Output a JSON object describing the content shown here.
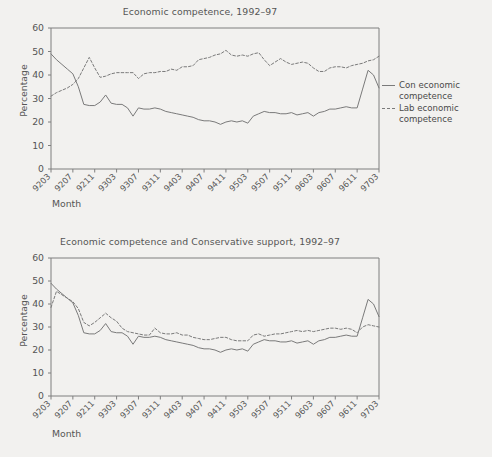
{
  "figure": {
    "background_color": "#f2f1ef",
    "line_color": "#7a7a7a",
    "text_color": "#555555",
    "axis_color": "#7f7f7f"
  },
  "panels": [
    {
      "id": "top",
      "title": "Economic competence, 1992–97",
      "ylabel": "Percentage",
      "xlabel": "Month",
      "legend": [
        {
          "label": "Con economic\ncompetence",
          "style": "solid"
        },
        {
          "label": "Lab economic\ncompetence",
          "style": "dashed"
        }
      ]
    },
    {
      "id": "bottom",
      "title": "Economic competence and Conservative support, 1992–97",
      "ylabel": "Percentage",
      "xlabel": "Month",
      "legend": [
        {
          "label": "Con economic\ncompetence",
          "style": "solid"
        },
        {
          "label": "Con support",
          "style": "dashed"
        }
      ]
    }
  ],
  "chart_data": [
    {
      "type": "line",
      "title": "Economic competence, 1992–97",
      "xlabel": "Month",
      "ylabel": "Percentage",
      "ylim": [
        0,
        60
      ],
      "yticks": [
        0,
        10,
        20,
        30,
        40,
        50,
        60
      ],
      "grid": false,
      "legend_position": "right",
      "xticks": [
        "9203",
        "9207",
        "9211",
        "9303",
        "9307",
        "9311",
        "9403",
        "9407",
        "9411",
        "9503",
        "9507",
        "9511",
        "9603",
        "9607",
        "9611",
        "9703"
      ],
      "x": [
        "9203",
        "9204",
        "9205",
        "9206",
        "9207",
        "9208",
        "9209",
        "9210",
        "9211",
        "9212",
        "9301",
        "9302",
        "9303",
        "9304",
        "9305",
        "9306",
        "9307",
        "9308",
        "9309",
        "9310",
        "9311",
        "9312",
        "9401",
        "9402",
        "9403",
        "9404",
        "9405",
        "9406",
        "9407",
        "9408",
        "9409",
        "9410",
        "9411",
        "9412",
        "9501",
        "9502",
        "9503",
        "9504",
        "9505",
        "9506",
        "9507",
        "9508",
        "9509",
        "9510",
        "9511",
        "9512",
        "9601",
        "9602",
        "9603",
        "9604",
        "9605",
        "9606",
        "9607",
        "9608",
        "9609",
        "9610",
        "9611",
        "9612",
        "9701",
        "9702",
        "9703"
      ],
      "series": [
        {
          "name": "Con economic competence",
          "style": "solid",
          "values": [
            49,
            46.5,
            44.5,
            42.5,
            40.5,
            35,
            27.5,
            27,
            27,
            28.5,
            31.5,
            28,
            27.5,
            27.5,
            26,
            22.5,
            26,
            25.5,
            25.5,
            26,
            25.5,
            24.5,
            24,
            23.5,
            23,
            22.5,
            22,
            21,
            20.5,
            20.5,
            20,
            19,
            20,
            20.5,
            20,
            20.5,
            19.5,
            22.5,
            23.5,
            24.5,
            24,
            24,
            23.5,
            23.5,
            24,
            23,
            23.5,
            24,
            22.5,
            24,
            24.5,
            25.5,
            25.5,
            26,
            26.5,
            26,
            26,
            34,
            42,
            40,
            34.5
          ]
        },
        {
          "name": "Lab economic competence",
          "style": "dashed",
          "values": [
            31,
            32.5,
            33.5,
            34.5,
            36,
            38.5,
            43,
            47.5,
            43,
            39,
            39.5,
            40.5,
            41,
            41,
            41,
            41,
            38.5,
            40.5,
            41,
            41,
            41.5,
            41.5,
            42.5,
            42,
            43.5,
            43.5,
            44,
            46.5,
            47,
            47.5,
            48.5,
            49,
            50.5,
            48.5,
            48,
            48.5,
            48,
            49,
            49.5,
            46.5,
            44,
            45.5,
            47,
            45.5,
            44.5,
            45,
            45.5,
            45,
            43,
            41.5,
            41.5,
            43,
            43.5,
            43.5,
            43,
            44,
            44.5,
            45,
            46,
            46.5,
            48
          ]
        }
      ]
    },
    {
      "type": "line",
      "title": "Economic competence and Conservative support, 1992–97",
      "xlabel": "Month",
      "ylabel": "Percentage",
      "ylim": [
        0,
        60
      ],
      "yticks": [
        0,
        10,
        20,
        30,
        40,
        50,
        60
      ],
      "grid": false,
      "legend_position": "right",
      "xticks": [
        "9203",
        "9207",
        "9211",
        "9303",
        "9307",
        "9311",
        "9403",
        "9407",
        "9411",
        "9503",
        "9507",
        "9511",
        "9603",
        "9607",
        "9611",
        "9703"
      ],
      "x": [
        "9203",
        "9204",
        "9205",
        "9206",
        "9207",
        "9208",
        "9209",
        "9210",
        "9211",
        "9212",
        "9301",
        "9302",
        "9303",
        "9304",
        "9305",
        "9306",
        "9307",
        "9308",
        "9309",
        "9310",
        "9311",
        "9312",
        "9401",
        "9402",
        "9403",
        "9404",
        "9405",
        "9406",
        "9407",
        "9408",
        "9409",
        "9410",
        "9411",
        "9412",
        "9501",
        "9502",
        "9503",
        "9504",
        "9505",
        "9506",
        "9507",
        "9508",
        "9509",
        "9510",
        "9511",
        "9512",
        "9601",
        "9602",
        "9603",
        "9604",
        "9605",
        "9606",
        "9607",
        "9608",
        "9609",
        "9610",
        "9611",
        "9612",
        "9701",
        "9702",
        "9703"
      ],
      "series": [
        {
          "name": "Con economic competence",
          "style": "solid",
          "values": [
            49,
            46.5,
            44.5,
            42.5,
            40.5,
            35,
            27.5,
            27,
            27,
            28.5,
            31.5,
            28,
            27.5,
            27.5,
            26,
            22.5,
            26,
            25.5,
            25.5,
            26,
            25.5,
            24.5,
            24,
            23.5,
            23,
            22.5,
            22,
            21,
            20.5,
            20.5,
            20,
            19,
            20,
            20.5,
            20,
            20.5,
            19.5,
            22.5,
            23.5,
            24.5,
            24,
            24,
            23.5,
            23.5,
            24,
            23,
            23.5,
            24,
            22.5,
            24,
            24.5,
            25.5,
            25.5,
            26,
            26.5,
            26,
            26,
            34,
            42,
            40,
            34.5
          ]
        },
        {
          "name": "Con support",
          "style": "dashed",
          "values": [
            38.5,
            45.5,
            44,
            42.5,
            41,
            38,
            32,
            30.5,
            32,
            34,
            36,
            34,
            32.5,
            29.5,
            28,
            27.5,
            27,
            26.5,
            26.5,
            29.5,
            27.5,
            27,
            27,
            27.5,
            26.5,
            26.5,
            25.5,
            25,
            24.5,
            24.5,
            25,
            25.5,
            25.5,
            24.5,
            24,
            24,
            24,
            26.5,
            27,
            26,
            26.5,
            27,
            27,
            27.5,
            28,
            28.5,
            28,
            28.5,
            28,
            28.5,
            29,
            29.5,
            29.5,
            29,
            29.5,
            29,
            27.5,
            30,
            31,
            30.5,
            30
          ]
        }
      ]
    }
  ]
}
